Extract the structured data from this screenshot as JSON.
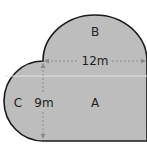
{
  "diagram": {
    "regions": [
      {
        "id": "A",
        "label": "A",
        "shape": "rectangle"
      },
      {
        "id": "B",
        "label": "B",
        "shape": "semicircle-top"
      },
      {
        "id": "C",
        "label": "C",
        "shape": "semicircle-left"
      }
    ],
    "dimensions": {
      "width_label": "12m",
      "height_label": "9m"
    },
    "colors": {
      "fill": "#bdbdbd",
      "stroke": "#1a1a1a",
      "dimension_line": "#8c8c8c",
      "highlight_line": "#e6e6e6"
    }
  }
}
